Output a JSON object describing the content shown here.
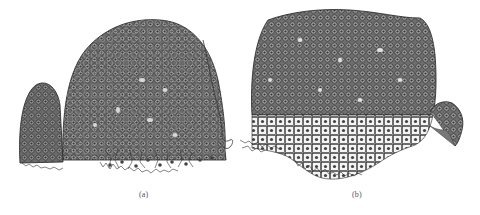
{
  "figure": {
    "panels": [
      {
        "id": "a",
        "label": "(a)",
        "description": "Shoot apex section with dome-shaped meristem, small lateral bud on left, and curved leaf outline on right"
      },
      {
        "id": "b",
        "label": "(b)",
        "description": "Broader flattened shoot apex section with lateral primordium on the right and vacuolated cells below"
      }
    ],
    "colors": {
      "ink": "#2a2a2a",
      "fill": "#5a5a5a",
      "background": "#ffffff"
    }
  }
}
